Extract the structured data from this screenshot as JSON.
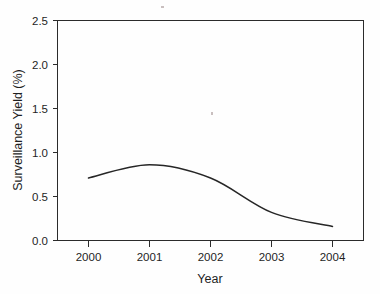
{
  "chart_data": {
    "type": "line",
    "title": "",
    "xlabel": "Year",
    "ylabel": "Surveillance Yield (%)",
    "categories": [
      "2000",
      "2001",
      "2002",
      "2003",
      "2004"
    ],
    "x": [
      2000,
      2001,
      2002,
      2003,
      2004
    ],
    "values": [
      0.71,
      0.86,
      0.71,
      0.32,
      0.16
    ],
    "series": [
      {
        "name": "Surveillance Yield",
        "values": [
          0.71,
          0.86,
          0.71,
          0.32,
          0.16
        ]
      }
    ],
    "xlim": [
      1999.5,
      2004.5
    ],
    "ylim": [
      0.0,
      2.5
    ],
    "x_tick_labels": [
      "2000",
      "2001",
      "2002",
      "2003",
      "2004"
    ],
    "y_tick_labels": [
      "0.0",
      "0.5",
      "1.0",
      "1.5",
      "2.0",
      "2.5"
    ],
    "y_ticks": [
      0.0,
      0.5,
      1.0,
      1.5,
      2.0,
      2.5
    ],
    "grid": false,
    "legend": false,
    "legend_position": "none",
    "line_color": "#262626",
    "smoothing": "spline",
    "markers": false,
    "annotations": []
  },
  "axes": {
    "y_labels": {
      "t0": "0.0",
      "t1": "0.5",
      "t2": "1.0",
      "t3": "1.5",
      "t4": "2.0",
      "t5": "2.5"
    },
    "x_labels": {
      "t0": "2000",
      "t1": "2001",
      "t2": "2002",
      "t3": "2003",
      "t4": "2004"
    },
    "x_title": "Year",
    "y_title": "Surveillance Yield (%)"
  },
  "style": {
    "background": "#fefefe",
    "axis_color": "#2b2b2b",
    "line_color": "#262626",
    "text_color": "#1f1f1f"
  }
}
